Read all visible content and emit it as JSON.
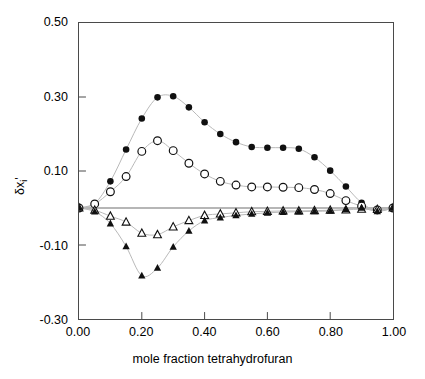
{
  "chart_data": {
    "type": "scatter",
    "title": "",
    "xlabel": "mole fraction tetrahydrofuran",
    "ylabel": "δxᵢ'",
    "ylabel_parts": {
      "delta": "δx",
      "sub": "i",
      "prime": "'"
    },
    "xlim": [
      0.0,
      1.0
    ],
    "ylim": [
      -0.3,
      0.5
    ],
    "xticks": [
      0.0,
      0.2,
      0.4,
      0.6,
      0.8,
      1.0
    ],
    "xtick_labels": [
      "0.00",
      "0.20",
      "0.40",
      "0.60",
      "0.80",
      "1.00"
    ],
    "yticks": [
      -0.3,
      -0.1,
      0.1,
      0.3,
      0.5
    ],
    "ytick_labels": [
      "-0.30",
      "-0.10",
      "0.10",
      "0.30",
      "0.50"
    ],
    "grid": false,
    "legend": "none",
    "zero_line": true,
    "connector_lines": true,
    "series": [
      {
        "name": "filled-circles",
        "marker": "filled-circle",
        "color": "#101010",
        "x": [
          0.0,
          0.05,
          0.1,
          0.15,
          0.2,
          0.25,
          0.3,
          0.35,
          0.4,
          0.45,
          0.5,
          0.55,
          0.6,
          0.65,
          0.7,
          0.75,
          0.8,
          0.85,
          0.9,
          0.95,
          1.0
        ],
        "y": [
          0.0,
          0.012,
          0.072,
          0.158,
          0.242,
          0.299,
          0.302,
          0.272,
          0.232,
          0.2,
          0.178,
          0.165,
          0.163,
          0.163,
          0.16,
          0.137,
          0.101,
          0.058,
          0.014,
          -0.008,
          0.0
        ]
      },
      {
        "name": "open-circles",
        "marker": "open-circle",
        "color": "#101010",
        "x": [
          0.0,
          0.05,
          0.1,
          0.15,
          0.2,
          0.25,
          0.3,
          0.35,
          0.4,
          0.45,
          0.5,
          0.55,
          0.6,
          0.65,
          0.7,
          0.75,
          0.8,
          0.85,
          0.9,
          0.95,
          1.0
        ],
        "y": [
          0.0,
          0.011,
          0.044,
          0.085,
          0.153,
          0.182,
          0.155,
          0.121,
          0.092,
          0.072,
          0.062,
          0.057,
          0.057,
          0.056,
          0.055,
          0.05,
          0.039,
          0.02,
          0.005,
          -0.005,
          0.0
        ]
      },
      {
        "name": "open-triangles",
        "marker": "open-triangle",
        "color": "#101010",
        "x": [
          0.0,
          0.05,
          0.1,
          0.15,
          0.2,
          0.25,
          0.3,
          0.35,
          0.4,
          0.45,
          0.5,
          0.55,
          0.6,
          0.65,
          0.7,
          0.75,
          0.8,
          0.85,
          0.9,
          0.95,
          1.0
        ],
        "y": [
          0.0,
          -0.006,
          -0.022,
          -0.038,
          -0.068,
          -0.072,
          -0.051,
          -0.034,
          -0.02,
          -0.016,
          -0.013,
          -0.01,
          -0.009,
          -0.008,
          -0.008,
          -0.007,
          -0.006,
          -0.005,
          -0.003,
          -0.004,
          0.0
        ]
      },
      {
        "name": "filled-triangles",
        "marker": "filled-triangle",
        "color": "#101010",
        "x": [
          0.0,
          0.05,
          0.1,
          0.15,
          0.2,
          0.25,
          0.3,
          0.35,
          0.4,
          0.45,
          0.5,
          0.55,
          0.6,
          0.65,
          0.7,
          0.75,
          0.8,
          0.85,
          0.9,
          0.95,
          1.0
        ],
        "y": [
          0.0,
          -0.01,
          -0.042,
          -0.104,
          -0.183,
          -0.162,
          -0.105,
          -0.062,
          -0.034,
          -0.026,
          -0.02,
          -0.016,
          -0.013,
          -0.011,
          -0.01,
          -0.009,
          -0.008,
          -0.004,
          0.0,
          -0.009,
          0.0
        ]
      }
    ]
  },
  "axes": {
    "y_title_delta": "δx",
    "y_title_sub": "i",
    "y_title_prime": "'",
    "x_title": "mole fraction tetrahydrofuran"
  },
  "colors": {
    "frame": "#4a4a4a",
    "marker": "#101010",
    "connector": "#b8b8b8",
    "zero_line": "#6e6e6e",
    "background": "#ffffff"
  }
}
